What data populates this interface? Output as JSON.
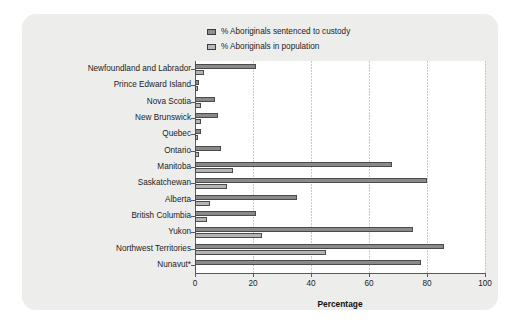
{
  "chart_data": {
    "type": "bar",
    "orientation": "horizontal",
    "title": "",
    "xlabel": "Percentage",
    "ylabel": "",
    "xlim": [
      0,
      100
    ],
    "xticks": [
      0,
      20,
      40,
      60,
      80,
      100
    ],
    "grid": true,
    "legend_position": "top-center",
    "categories": [
      "Newfoundland and Labrador",
      "Prince Edward Island",
      "Nova Scotia",
      "New Brunswick",
      "Quebec",
      "Ontario",
      "Manitoba",
      "Saskatchewan",
      "Alberta",
      "British Columbia",
      "Yukon",
      "Northwest Territories",
      "Nunavut*"
    ],
    "series": [
      {
        "name": "% Aboriginals sentenced to custody",
        "color": "#8a8a8a",
        "values": [
          21,
          1.5,
          7,
          8,
          2,
          9,
          68,
          80,
          35,
          21,
          75,
          86,
          78
        ]
      },
      {
        "name": "% Aboriginals in population",
        "color": "#b4b4b4",
        "values": [
          3,
          1,
          2,
          2,
          1,
          1.5,
          13,
          11,
          5,
          4,
          23,
          45,
          0
        ]
      }
    ]
  },
  "legend": {
    "items": [
      {
        "label": "% Aboriginals sentenced to custody",
        "swatch": "sw-custody"
      },
      {
        "label": "% Aboriginals in population",
        "swatch": "sw-population"
      }
    ]
  },
  "axis": {
    "x_title": "Percentage",
    "x_tick_labels": [
      "0",
      "20",
      "40",
      "60",
      "80",
      "100"
    ]
  },
  "colors": {
    "panel_background": "#ededec",
    "plot_background": "#ffffff",
    "axis": "#5a5a5a",
    "gridline": "#c9c9c9",
    "series_custody": "#8a8a8a",
    "series_population": "#b4b4b4"
  }
}
